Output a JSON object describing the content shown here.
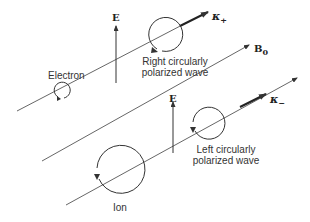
{
  "diagram": {
    "labels": {
      "e_field_top": "E",
      "e_field_bottom": "E",
      "kappa_plus": "κ",
      "kappa_plus_sub": "+",
      "kappa_minus": "κ",
      "kappa_minus_sub": "−",
      "b0": "B",
      "b0_sub": "0",
      "electron": "Electron",
      "ion": "Ion",
      "right_wave_line1": "Right circularly",
      "right_wave_line2": "polarized wave",
      "left_wave_line1": "Left circularly",
      "left_wave_line2": "polarized wave"
    },
    "colors": {
      "line": "#444444",
      "text": "#333333",
      "background": "#ffffff"
    }
  }
}
